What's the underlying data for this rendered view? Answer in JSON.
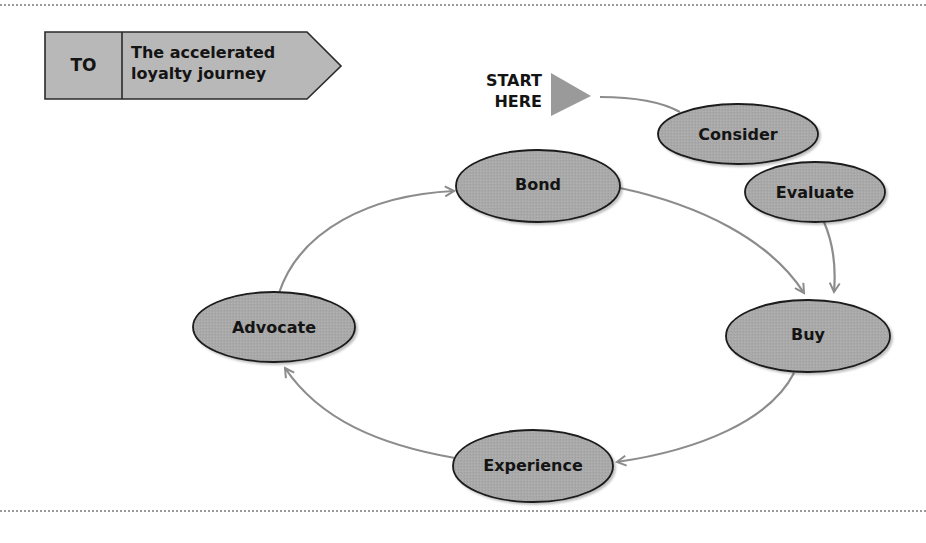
{
  "header": {
    "tag": "TO",
    "title_line1": "The accelerated",
    "title_line2": "loyalty journey"
  },
  "start": {
    "line1": "START",
    "line2": "HERE"
  },
  "nodes": {
    "consider": "Consider",
    "evaluate": "Evaluate",
    "buy": "Buy",
    "experience": "Experience",
    "advocate": "Advocate",
    "bond": "Bond"
  },
  "colors": {
    "node_fill": "#a9a9a9",
    "node_stroke": "#1a1a1a",
    "arrow": "#8c8c8c",
    "header_fill": "#b8b8b8",
    "start_triangle": "#9a9a9a",
    "rule": "#9a9a9a"
  },
  "flow": [
    {
      "from": "START HERE",
      "to": "Consider"
    },
    {
      "from": "Consider",
      "to": "Evaluate"
    },
    {
      "from": "Evaluate",
      "to": "Buy"
    },
    {
      "from": "Buy",
      "to": "Experience"
    },
    {
      "from": "Experience",
      "to": "Advocate"
    },
    {
      "from": "Advocate",
      "to": "Bond"
    },
    {
      "from": "Bond",
      "to": "Buy"
    }
  ]
}
